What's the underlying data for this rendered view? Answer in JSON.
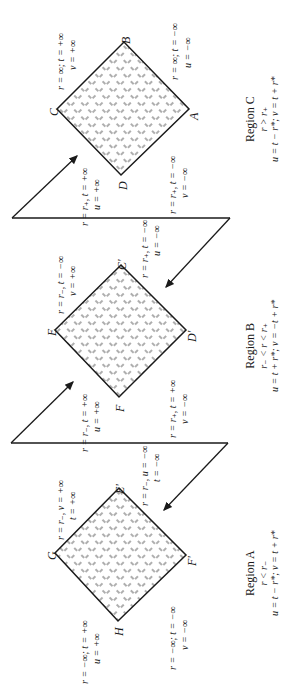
{
  "diagram": {
    "orientation": "rotated 90° counter-clockwise",
    "regions": [
      {
        "id": "C",
        "title": "Region C",
        "condition": "r > r₊",
        "equation": "u = t − r*; v = t + r*",
        "vertices": [
          {
            "name": "C",
            "label": "C"
          },
          {
            "name": "B",
            "label": "B"
          },
          {
            "name": "A",
            "label": "A"
          },
          {
            "name": "D",
            "label": "D"
          }
        ],
        "edge_labels": {
          "CB": [
            "r = ∞; t = +∞",
            "v = +∞"
          ],
          "BA": [
            "r = ∞; t = −∞",
            "u = −∞"
          ],
          "CD": [
            "r = r₊, t = +∞",
            "u = +∞"
          ],
          "DA": [
            "r = r₊, t = −∞",
            "v = −∞"
          ]
        }
      },
      {
        "id": "B",
        "title": "Region B",
        "condition": "r₋ < r < r₊",
        "equation": "u = t + r*; v = −t + r*",
        "vertices": [
          {
            "name": "E",
            "label": "E"
          },
          {
            "name": "C'",
            "label": "C'"
          },
          {
            "name": "D'",
            "label": "D'"
          },
          {
            "name": "F",
            "label": "F"
          }
        ],
        "edge_labels": {
          "EC'": [
            "r = r₋, t = −∞",
            "v = +∞"
          ],
          "C'D'": [
            "r = r₊, t = −∞",
            "u = −∞"
          ],
          "EF": [
            "r = r₋, t = +∞",
            "u = +∞"
          ],
          "FD'": [
            "r = r₊, t = +∞",
            "v = −∞"
          ]
        }
      },
      {
        "id": "A",
        "title": "Region A",
        "condition": "r < r₋",
        "equation": "u = t − r*; v = t + r*",
        "vertices": [
          {
            "name": "G",
            "label": "G"
          },
          {
            "name": "E'",
            "label": "E'"
          },
          {
            "name": "F'",
            "label": "F'"
          },
          {
            "name": "H",
            "label": "H"
          }
        ],
        "edge_labels": {
          "GE'": [
            "r = r₋, v = +∞",
            "t = +∞"
          ],
          "E'F'": [
            "r = r₋, u = −∞",
            "t = −∞"
          ],
          "GH": [
            "r = −∞; t = +∞",
            "u = +∞"
          ],
          "HF'": [
            "r = −∞; t = −∞",
            "v = −∞"
          ]
        }
      }
    ]
  }
}
